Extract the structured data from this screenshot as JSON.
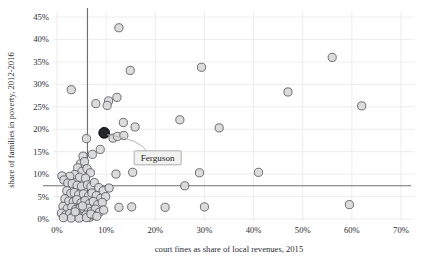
{
  "chart_data": {
    "type": "scatter",
    "title": "",
    "xlabel": "court fines as share of local revenues, 2015",
    "ylabel": "share of families in poverty, 2012-2016",
    "xlim": [
      0,
      70
    ],
    "ylim": [
      0,
      45
    ],
    "xticks": [
      0,
      10,
      20,
      30,
      40,
      50,
      60,
      70
    ],
    "yticks": [
      0,
      5,
      10,
      15,
      20,
      25,
      30,
      35,
      40,
      45
    ],
    "xtick_labels": [
      "0%",
      "10%",
      "20%",
      "30%",
      "40%",
      "50%",
      "60%",
      "70%"
    ],
    "ytick_labels": [
      "0%",
      "5%",
      "10%",
      "15%",
      "20%",
      "25%",
      "30%",
      "35%",
      "40%",
      "45%"
    ],
    "grid": true,
    "legend": "none",
    "reference_lines": [
      {
        "name": "vertical-median-line",
        "orientation": "vertical",
        "value": 6.2
      },
      {
        "name": "horizontal-median-line",
        "orientation": "horizontal",
        "value": 7.4
      }
    ],
    "annotations": [
      {
        "label": "Ferguson",
        "x": 9.6,
        "y": 19.2,
        "highlighted": true
      }
    ],
    "points": [
      {
        "x": 9.6,
        "y": 19.2,
        "highlight": true
      },
      {
        "x": 12.6,
        "y": 42.6
      },
      {
        "x": 2.9,
        "y": 28.8
      },
      {
        "x": 14.9,
        "y": 33.1
      },
      {
        "x": 29.4,
        "y": 33.8
      },
      {
        "x": 56.0,
        "y": 36.0
      },
      {
        "x": 7.9,
        "y": 25.7
      },
      {
        "x": 10.5,
        "y": 26.3
      },
      {
        "x": 10.2,
        "y": 25.3
      },
      {
        "x": 12.2,
        "y": 27.1
      },
      {
        "x": 47.0,
        "y": 28.3
      },
      {
        "x": 62.0,
        "y": 25.2
      },
      {
        "x": 13.5,
        "y": 21.5
      },
      {
        "x": 25.0,
        "y": 22.1
      },
      {
        "x": 15.9,
        "y": 20.5
      },
      {
        "x": 33.0,
        "y": 20.3
      },
      {
        "x": 6.0,
        "y": 17.9
      },
      {
        "x": 11.4,
        "y": 18.0
      },
      {
        "x": 12.3,
        "y": 18.4
      },
      {
        "x": 13.6,
        "y": 18.6
      },
      {
        "x": 8.8,
        "y": 15.5
      },
      {
        "x": 7.2,
        "y": 14.4
      },
      {
        "x": 5.3,
        "y": 14.0
      },
      {
        "x": 4.8,
        "y": 12.3
      },
      {
        "x": 5.6,
        "y": 12.8
      },
      {
        "x": 4.2,
        "y": 11.4
      },
      {
        "x": 5.1,
        "y": 10.6
      },
      {
        "x": 6.1,
        "y": 11.2
      },
      {
        "x": 6.8,
        "y": 10.3
      },
      {
        "x": 3.6,
        "y": 9.9
      },
      {
        "x": 4.6,
        "y": 9.3
      },
      {
        "x": 5.8,
        "y": 9.1
      },
      {
        "x": 2.6,
        "y": 9.5
      },
      {
        "x": 1.0,
        "y": 9.6
      },
      {
        "x": 1.4,
        "y": 8.7
      },
      {
        "x": 2.2,
        "y": 8.0
      },
      {
        "x": 3.1,
        "y": 7.9
      },
      {
        "x": 4.1,
        "y": 7.5
      },
      {
        "x": 5.0,
        "y": 7.3
      },
      {
        "x": 6.2,
        "y": 7.6
      },
      {
        "x": 6.9,
        "y": 7.2
      },
      {
        "x": 7.6,
        "y": 8.1
      },
      {
        "x": 8.5,
        "y": 7.0
      },
      {
        "x": 9.4,
        "y": 6.3
      },
      {
        "x": 10.6,
        "y": 6.9
      },
      {
        "x": 12.0,
        "y": 10.0
      },
      {
        "x": 15.4,
        "y": 10.4
      },
      {
        "x": 29.0,
        "y": 10.3
      },
      {
        "x": 41.0,
        "y": 10.4
      },
      {
        "x": 26.0,
        "y": 7.4
      },
      {
        "x": 2.0,
        "y": 6.3
      },
      {
        "x": 2.8,
        "y": 5.7
      },
      {
        "x": 3.5,
        "y": 5.9
      },
      {
        "x": 4.4,
        "y": 5.4
      },
      {
        "x": 5.4,
        "y": 5.6
      },
      {
        "x": 6.4,
        "y": 5.1
      },
      {
        "x": 7.1,
        "y": 5.8
      },
      {
        "x": 8.0,
        "y": 5.2
      },
      {
        "x": 8.9,
        "y": 4.6
      },
      {
        "x": 9.9,
        "y": 5.0
      },
      {
        "x": 1.6,
        "y": 4.5
      },
      {
        "x": 2.4,
        "y": 4.0
      },
      {
        "x": 3.3,
        "y": 3.8
      },
      {
        "x": 4.0,
        "y": 4.3
      },
      {
        "x": 4.9,
        "y": 3.6
      },
      {
        "x": 5.7,
        "y": 4.1
      },
      {
        "x": 6.6,
        "y": 3.4
      },
      {
        "x": 7.4,
        "y": 3.9
      },
      {
        "x": 8.3,
        "y": 3.2
      },
      {
        "x": 9.2,
        "y": 3.7
      },
      {
        "x": 12.6,
        "y": 2.6
      },
      {
        "x": 15.2,
        "y": 2.7
      },
      {
        "x": 22.0,
        "y": 2.6
      },
      {
        "x": 30.0,
        "y": 2.7
      },
      {
        "x": 59.5,
        "y": 3.2
      },
      {
        "x": 1.2,
        "y": 2.8
      },
      {
        "x": 2.1,
        "y": 2.3
      },
      {
        "x": 3.0,
        "y": 2.6
      },
      {
        "x": 3.8,
        "y": 2.1
      },
      {
        "x": 4.7,
        "y": 2.5
      },
      {
        "x": 5.5,
        "y": 1.9
      },
      {
        "x": 6.3,
        "y": 2.4
      },
      {
        "x": 7.0,
        "y": 1.7
      },
      {
        "x": 7.8,
        "y": 2.2
      },
      {
        "x": 8.6,
        "y": 1.5
      },
      {
        "x": 9.5,
        "y": 2.0
      },
      {
        "x": 0.9,
        "y": 1.3
      },
      {
        "x": 1.8,
        "y": 0.9
      },
      {
        "x": 2.6,
        "y": 1.2
      },
      {
        "x": 3.4,
        "y": 0.7
      },
      {
        "x": 4.2,
        "y": 1.0
      },
      {
        "x": 5.0,
        "y": 0.5
      },
      {
        "x": 5.9,
        "y": 0.9
      },
      {
        "x": 6.7,
        "y": 0.4
      },
      {
        "x": 7.5,
        "y": 0.8
      },
      {
        "x": 2.9,
        "y": 0.2
      },
      {
        "x": 4.5,
        "y": 0.2
      },
      {
        "x": 6.0,
        "y": 0.3
      },
      {
        "x": 1.3,
        "y": 0.3
      },
      {
        "x": 3.7,
        "y": 1.6
      },
      {
        "x": 5.2,
        "y": 2.9
      },
      {
        "x": 6.9,
        "y": 1.1
      },
      {
        "x": 8.1,
        "y": 0.6
      }
    ]
  }
}
